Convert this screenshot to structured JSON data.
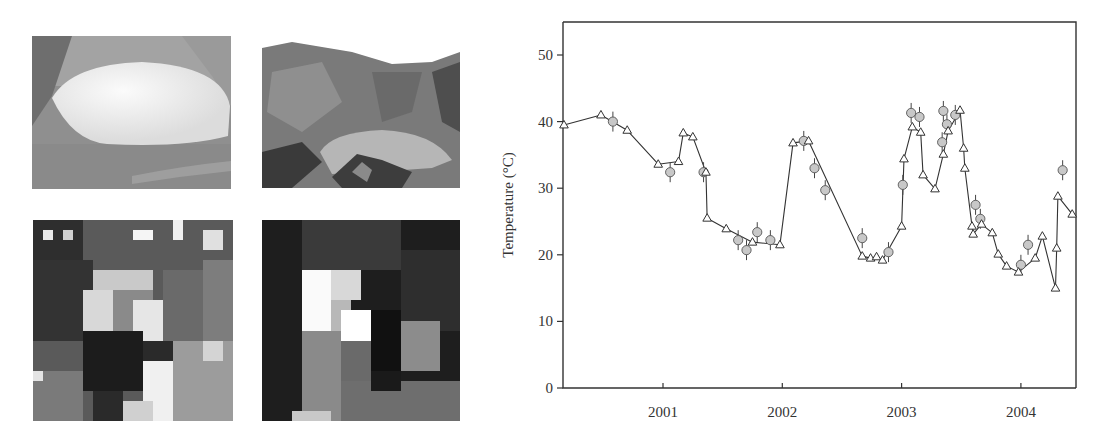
{
  "images": [
    {
      "id": "photo-crater-lake-1",
      "description": "grayscale photograph of crater lake (aerial, bright lake)"
    },
    {
      "id": "photo-crater-lake-2",
      "description": "grayscale photograph of crater lake with crater walls"
    },
    {
      "id": "thermal-image-1",
      "description": "pixelated grayscale thermal image"
    },
    {
      "id": "thermal-image-2",
      "description": "pixelated grayscale thermal image"
    }
  ],
  "chart_data": {
    "type": "line",
    "title": "",
    "xlabel": "",
    "ylabel": "Temperature (°C)",
    "ylim": [
      0,
      55
    ],
    "yticks": [
      0,
      10,
      20,
      30,
      40,
      50
    ],
    "ytick_labels": [
      "0",
      "10",
      "20",
      "30",
      "40",
      "50"
    ],
    "xlim": [
      2000.16,
      2004.47
    ],
    "xticks": [
      2001,
      2002,
      2003,
      2004
    ],
    "xtick_labels": [
      "2001",
      "2002",
      "2003",
      "2004"
    ],
    "grid": false,
    "legend": null,
    "series": [
      {
        "name": "Triangles (connected line)",
        "marker": "triangle-open",
        "x": [
          2000.17,
          2000.48,
          2000.7,
          2000.96,
          2001.13,
          2001.17,
          2001.25,
          2001.36,
          2001.37,
          2001.53,
          2001.75,
          2001.98,
          2002.09,
          2002.22,
          2002.67,
          2002.74,
          2002.79,
          2002.84,
          2003.0,
          2003.02,
          2003.09,
          2003.16,
          2003.18,
          2003.28,
          2003.35,
          2003.39,
          2003.49,
          2003.52,
          2003.53,
          2003.59,
          2003.6,
          2003.67,
          2003.76,
          2003.81,
          2003.88,
          2003.98,
          2004.12,
          2004.18,
          2004.29,
          2004.3,
          2004.31,
          2004.43
        ],
        "values": [
          39.5,
          41.0,
          38.7,
          33.6,
          34.0,
          38.3,
          37.7,
          32.4,
          25.5,
          23.9,
          21.9,
          21.5,
          36.8,
          37.1,
          19.8,
          19.5,
          19.7,
          19.2,
          24.3,
          34.4,
          39.2,
          38.4,
          32.0,
          29.9,
          35.1,
          38.6,
          41.7,
          36.0,
          33.0,
          24.3,
          23.1,
          24.6,
          23.3,
          20.1,
          18.3,
          17.4,
          19.5,
          22.8,
          15.0,
          21.0,
          28.8,
          26.1
        ]
      },
      {
        "name": "Circles (with error bars)",
        "marker": "circle-filled-gray",
        "x": [
          2000.58,
          2001.06,
          2001.34,
          2001.63,
          2001.7,
          2001.79,
          2001.9,
          2002.18,
          2002.27,
          2002.36,
          2002.67,
          2002.89,
          2003.01,
          2003.08,
          2003.15,
          2003.34,
          2003.35,
          2003.38,
          2003.45,
          2003.62,
          2003.66,
          2004.0,
          2004.06,
          2004.35
        ],
        "values": [
          40.0,
          32.4,
          32.4,
          22.2,
          20.7,
          23.4,
          22.2,
          37.1,
          33.0,
          29.7,
          22.5,
          20.4,
          30.5,
          41.3,
          40.7,
          36.9,
          41.6,
          39.6,
          41.0,
          27.5,
          25.4,
          18.5,
          21.5,
          32.7
        ],
        "error": 1.5
      }
    ]
  }
}
